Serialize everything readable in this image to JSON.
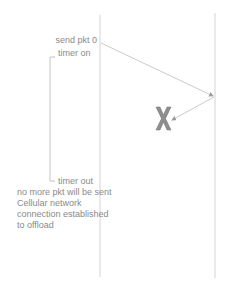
{
  "diagram": {
    "type": "sequence-timeline",
    "lifelines": [
      {
        "id": "sender",
        "x": 100,
        "y1": 15,
        "y2": 277
      },
      {
        "id": "receiver",
        "x": 215,
        "y1": 13,
        "y2": 278
      }
    ],
    "messages": [
      {
        "id": "send-pkt-0",
        "from": [
          101,
          43
        ],
        "to": [
          214,
          96
        ]
      },
      {
        "id": "lost-reply",
        "from": [
          214,
          97
        ],
        "to": [
          172,
          120
        ]
      }
    ],
    "loss_marker": {
      "symbol": "X",
      "x": 163,
      "y": 118,
      "color": "#7a7a7a"
    },
    "timer_bracket": {
      "x": 50,
      "y1": 57,
      "y2": 181
    },
    "labels": {
      "send": "send pkt 0",
      "timer_on": "timer on",
      "timer_out": "timer out",
      "no_more": "no more pkt will be sent",
      "cellular": "Cellular network",
      "connection": "connection established",
      "offload": "to offload"
    },
    "colors": {
      "line": "#d0d0d0",
      "arrow": "#b8b8b8",
      "text": "#8a8a8a",
      "x_marker": "#7a7a7a"
    }
  }
}
